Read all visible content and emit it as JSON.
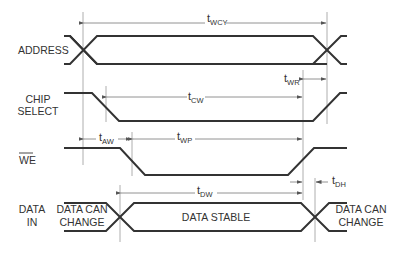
{
  "diagram": {
    "type": "write-cycle timing diagram",
    "signals": [
      {
        "id": "address",
        "label_line1": "ADDRESS",
        "label_line2": ""
      },
      {
        "id": "chip_select",
        "label_line1": "CHIP",
        "label_line2": "SELECT"
      },
      {
        "id": "we",
        "label_line1": "WE",
        "label_line2": "",
        "overbar": true
      },
      {
        "id": "data_in",
        "label_line1": "DATA",
        "label_line2": "IN"
      }
    ],
    "data_states": {
      "left_line1": "DATA CAN",
      "left_line2": "CHANGE",
      "middle": "DATA STABLE",
      "right_line1": "DATA CAN",
      "right_line2": "CHANGE"
    },
    "timing_params": [
      {
        "id": "wcy",
        "base": "t",
        "sub": "WCY"
      },
      {
        "id": "wr",
        "base": "t",
        "sub": "WR"
      },
      {
        "id": "cw",
        "base": "t",
        "sub": "CW"
      },
      {
        "id": "aw",
        "base": "t",
        "sub": "AW"
      },
      {
        "id": "wp",
        "base": "t",
        "sub": "WP"
      },
      {
        "id": "dw",
        "base": "t",
        "sub": "DW"
      },
      {
        "id": "dh",
        "base": "t",
        "sub": "DH"
      }
    ]
  }
}
